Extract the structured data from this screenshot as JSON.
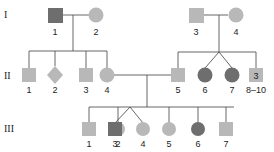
{
  "colors": {
    "unaffected": "#b8b8b8",
    "affected": "#6e6e6e",
    "line": "#555555",
    "text": "#222222"
  },
  "generations": [
    {
      "label": "I"
    },
    {
      "label": "II"
    },
    {
      "label": "III"
    }
  ],
  "individuals": {
    "I_1": {
      "label": "1",
      "sex": "male",
      "affected": true
    },
    "I_2": {
      "label": "2",
      "sex": "female",
      "affected": false
    },
    "I_3": {
      "label": "3",
      "sex": "male",
      "affected": false
    },
    "I_4": {
      "label": "4",
      "sex": "female",
      "affected": false
    },
    "II_1": {
      "label": "1",
      "sex": "male",
      "affected": false
    },
    "II_2": {
      "label": "2",
      "sex": "unknown",
      "affected": false
    },
    "II_3": {
      "label": "3",
      "sex": "male",
      "affected": false
    },
    "II_4": {
      "label": "4",
      "sex": "female",
      "affected": false
    },
    "II_5": {
      "label": "5",
      "sex": "male",
      "affected": false
    },
    "II_6": {
      "label": "6",
      "sex": "female",
      "affected": true,
      "twin_of": "II_7"
    },
    "II_7": {
      "label": "7",
      "sex": "female",
      "affected": true,
      "twin_of": "II_6"
    },
    "II_8_10": {
      "label": "8–10",
      "sex": "male",
      "affected": false,
      "count": "3"
    },
    "III_1": {
      "label": "1",
      "sex": "male",
      "affected": false
    },
    "III_2": {
      "label": "2",
      "sex": "female",
      "affected": false
    },
    "III_3": {
      "label": "3",
      "sex": "male",
      "affected": true,
      "twin_of": "III_4"
    },
    "III_4": {
      "label": "4",
      "sex": "female",
      "affected": false,
      "twin_of": "III_3"
    },
    "III_5": {
      "label": "5",
      "sex": "female",
      "affected": false
    },
    "III_6": {
      "label": "6",
      "sex": "female",
      "affected": true
    },
    "III_7": {
      "label": "7",
      "sex": "male",
      "affected": false
    }
  }
}
